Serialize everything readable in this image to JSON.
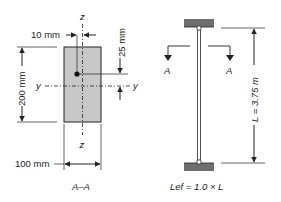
{
  "section": {
    "title": "A–A",
    "width_label": "100 mm",
    "height_label": "200 mm",
    "bar_offset_label": "10 mm",
    "cover_label": "25 mm",
    "axis_z": "z",
    "axis_y": "y",
    "fill_color": "#c8c8c8"
  },
  "column": {
    "section_mark_left": "A",
    "section_mark_right": "A",
    "length_label": "L = 3.75 m",
    "effective_length_label": "Lef = 1.0 × L",
    "support_color": "#6e6e6e"
  }
}
